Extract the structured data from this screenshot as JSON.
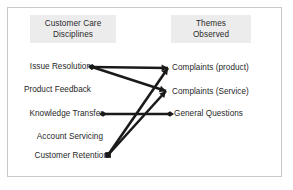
{
  "frame": {
    "border_color": "#c9c9c9",
    "background_color": "#ffffff"
  },
  "headers": {
    "left": {
      "line1": "Customer Care",
      "line2": "Disciplines",
      "background_color": "#ececec"
    },
    "right": {
      "line1": "Themes",
      "line2": "Observed",
      "background_color": "#ececec"
    }
  },
  "left_column": {
    "items": [
      {
        "id": "issue-resolution",
        "label": "Issue Resolution"
      },
      {
        "id": "product-feedback",
        "label": "Product Feedback"
      },
      {
        "id": "knowledge-transfer",
        "label": "Knowledge Transfer"
      },
      {
        "id": "account-servicing",
        "label": "Account Servicing"
      },
      {
        "id": "customer-retention",
        "label": "Customer Retention"
      }
    ]
  },
  "right_column": {
    "items": [
      {
        "id": "complaints-product",
        "label": "Complaints (product)"
      },
      {
        "id": "complaints-service",
        "label": "Complaints (Service)"
      },
      {
        "id": "general-questions",
        "label": "General Questions"
      }
    ]
  },
  "chart_data": {
    "type": "diagram",
    "title": "",
    "line_color": "#1a1a1a",
    "nodes": {
      "left": [
        {
          "id": "issue-resolution",
          "label": "Issue Resolution",
          "x": 92,
          "y": 67
        },
        {
          "id": "product-feedback",
          "label": "Product Feedback",
          "x": 92,
          "y": 90
        },
        {
          "id": "knowledge-transfer",
          "label": "Knowledge Transfer",
          "x": 103,
          "y": 114
        },
        {
          "id": "account-servicing",
          "label": "Account Servicing",
          "x": 103,
          "y": 137
        },
        {
          "id": "customer-retention",
          "label": "Customer Retention",
          "x": 108,
          "y": 155
        }
      ],
      "right": [
        {
          "id": "complaints-product",
          "label": "Complaints (product)",
          "x": 168,
          "y": 68
        },
        {
          "id": "complaints-service",
          "label": "Complaints (Service)",
          "x": 166,
          "y": 91
        },
        {
          "id": "general-questions",
          "label": "General Questions",
          "x": 170,
          "y": 114
        }
      ]
    },
    "links": [
      {
        "from": "issue-resolution",
        "to": "complaints-product",
        "marker_from": "diamond",
        "marker_to": "arrow"
      },
      {
        "from": "issue-resolution",
        "to": "complaints-service",
        "marker_from": "diamond",
        "marker_to": "arrow"
      },
      {
        "from": "knowledge-transfer",
        "to": "general-questions",
        "marker_from": "diamond",
        "marker_to": "diamond"
      },
      {
        "from": "customer-retention",
        "to": "complaints-product",
        "marker_from": "square",
        "marker_to": "arrow"
      },
      {
        "from": "customer-retention",
        "to": "complaints-service",
        "marker_from": "square",
        "marker_to": "arrow"
      }
    ]
  }
}
